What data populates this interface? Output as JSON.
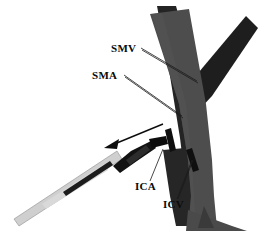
{
  "figure": {
    "type": "anatomical-line-diagram",
    "background_color": "#ffffff"
  },
  "labels": [
    {
      "id": "smv",
      "text": "SMV",
      "meaning": "superior-mesenteric-vein",
      "x": 111,
      "y": 52,
      "leader_from": [
        141,
        49
      ],
      "leader_to": [
        196,
        80
      ]
    },
    {
      "id": "sma",
      "text": "SMA",
      "meaning": "superior-mesenteric-artery",
      "x": 92,
      "y": 79,
      "leader_from": [
        124,
        76
      ],
      "leader_to": [
        181,
        116
      ]
    },
    {
      "id": "ica",
      "text": "ICA",
      "meaning": "ileocolic-artery",
      "x": 135,
      "y": 190,
      "leader_from": [
        149,
        181
      ],
      "leader_to": [
        162,
        151
      ]
    },
    {
      "id": "icv",
      "text": "ICV",
      "meaning": "ileocolic-vein",
      "x": 163,
      "y": 208,
      "leader_from": [
        176,
        199
      ],
      "leader_to": [
        192,
        163
      ]
    }
  ],
  "vessels": [
    {
      "id": "smv-trunk",
      "name": "SMV trunk",
      "color": "#4a4a4a",
      "role": "main-vein-band"
    },
    {
      "id": "sma-trunk",
      "name": "SMA trunk",
      "color": "#232323",
      "role": "main-artery-band"
    },
    {
      "id": "sma-branch",
      "name": "SMA upper branch",
      "color": "#1d1d1d",
      "role": "branch-band"
    }
  ],
  "instrument": {
    "id": "dissector",
    "name": "surgical dissector",
    "shaft_color": "#cccccc",
    "tip_color": "#111111",
    "stripe_color": "#1a1a1a"
  },
  "motion_arrow": {
    "id": "traction-arrow",
    "name": "traction direction arrow",
    "direction": "down-left",
    "color": "#0d0d0d",
    "from": [
      163,
      124
    ],
    "to": [
      106,
      147
    ]
  },
  "clips": [
    {
      "id": "clip-ica",
      "name": "ICA clip",
      "color": "#0f0f0f"
    },
    {
      "id": "clip-icv",
      "name": "ICV clip",
      "color": "#0f0f0f"
    }
  ]
}
